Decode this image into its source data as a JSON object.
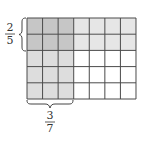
{
  "diagram": {
    "grid": {
      "columns": 7,
      "rows": 5,
      "shaded_columns": 3,
      "shaded_rows": 2
    },
    "row_fraction": {
      "numerator": "2",
      "denominator": "5"
    },
    "column_fraction": {
      "numerator": "3",
      "denominator": "7"
    },
    "colors": {
      "overlap": "#c6c6c6",
      "column_shade": "#dddddd",
      "row_shade": "#e6e6e6",
      "empty": "#ffffff",
      "line": "#4a4a4a",
      "text": "#333333"
    }
  }
}
